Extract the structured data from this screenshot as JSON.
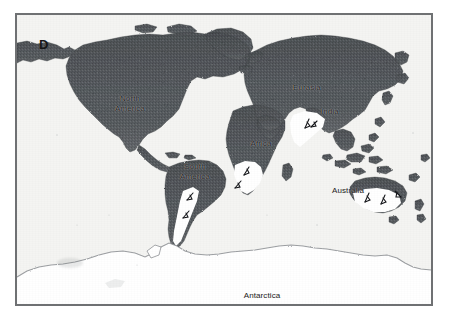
{
  "figure": {
    "panel_letter": "D",
    "background_color": "#ffffff",
    "frame_color": "#6f7173",
    "ocean_color": "#f4f4f2",
    "land_color": "#565a5e",
    "ice_color": "#ffffff",
    "label_color": "#1b1b1b"
  },
  "map": {
    "projection": "equirectangular",
    "type": "paleogeographic-glaciation-map",
    "labels": [
      {
        "name": "north-america",
        "text": "North\nAmerica",
        "x": 113,
        "y": 84
      },
      {
        "name": "south-america",
        "text": "South\nAmerica",
        "x": 178,
        "y": 152
      },
      {
        "name": "eurasia",
        "text": "Eurasia",
        "x": 290,
        "y": 73
      },
      {
        "name": "india",
        "text": "India",
        "x": 313,
        "y": 97
      },
      {
        "name": "africa",
        "text": "Africa",
        "x": 244,
        "y": 129
      },
      {
        "name": "australia",
        "text": "Australia",
        "x": 331,
        "y": 176
      },
      {
        "name": "antarctica",
        "text": "Antarctica",
        "x": 245,
        "y": 281
      }
    ],
    "legend_continents": [
      "North America",
      "South America",
      "Eurasia",
      "India",
      "Africa",
      "Australia",
      "Antarctica"
    ],
    "glaciated_regions": [
      "Southern South America (Patagonia)",
      "Southern Africa",
      "India",
      "Southern Australia",
      "Antarctica"
    ],
    "ice_flow_arrow_count": 9
  }
}
